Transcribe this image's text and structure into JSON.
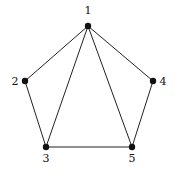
{
  "graph": {
    "nodes": [
      {
        "id": "1",
        "label": "1",
        "x": 88,
        "y": 26,
        "lx": 88,
        "ly": 14
      },
      {
        "id": "2",
        "label": "2",
        "x": 25,
        "y": 81,
        "lx": 15,
        "ly": 85
      },
      {
        "id": "3",
        "label": "3",
        "x": 46,
        "y": 147,
        "lx": 46,
        "ly": 162
      },
      {
        "id": "4",
        "label": "4",
        "x": 153,
        "y": 81,
        "lx": 163,
        "ly": 85
      },
      {
        "id": "5",
        "label": "5",
        "x": 132,
        "y": 147,
        "lx": 132,
        "ly": 162
      }
    ],
    "edges": [
      [
        "1",
        "2"
      ],
      [
        "1",
        "3"
      ],
      [
        "1",
        "5"
      ],
      [
        "1",
        "4"
      ],
      [
        "2",
        "3"
      ],
      [
        "3",
        "5"
      ],
      [
        "4",
        "5"
      ]
    ],
    "node_color": "#111111",
    "edge_color": "#222222"
  }
}
